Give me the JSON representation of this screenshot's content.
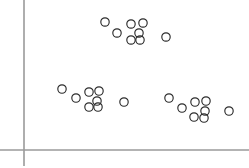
{
  "chart_data": {
    "type": "scatter",
    "title": "",
    "subtitle": "",
    "xlabel": "",
    "ylabel": "",
    "xlim": [
      0,
      249
    ],
    "ylim": [
      0,
      168
    ],
    "grid": false,
    "legend": null,
    "legend_position": "none",
    "tick_labels": {
      "x": [],
      "y": []
    },
    "annotations": [],
    "marker": {
      "shape": "open-circle",
      "radius": 4.2,
      "fill": "none",
      "stroke_color": "#2b2b2b",
      "stroke_width": 1.15
    },
    "axes": {
      "color": "#9a9a9a",
      "width": 1.6,
      "y_axis": {
        "x": 24,
        "y_start": 0,
        "y_end": 166
      },
      "x_axis": {
        "y": 150,
        "x_start": 0,
        "x_end": 249
      }
    },
    "series": [
      {
        "name": "cluster-top",
        "n_points": 9,
        "points": [
          {
            "x": 105,
            "y": 22
          },
          {
            "x": 117,
            "y": 33
          },
          {
            "x": 131,
            "y": 24
          },
          {
            "x": 143,
            "y": 23
          },
          {
            "x": 139,
            "y": 33
          },
          {
            "x": 131,
            "y": 40
          },
          {
            "x": 140,
            "y": 40
          },
          {
            "x": 166,
            "y": 37
          }
        ]
      },
      {
        "name": "cluster-left",
        "n_points": 8,
        "points": [
          {
            "x": 62,
            "y": 89
          },
          {
            "x": 76,
            "y": 98
          },
          {
            "x": 89,
            "y": 92
          },
          {
            "x": 99,
            "y": 91
          },
          {
            "x": 97,
            "y": 101
          },
          {
            "x": 89,
            "y": 107
          },
          {
            "x": 98,
            "y": 107
          },
          {
            "x": 124,
            "y": 102
          }
        ]
      },
      {
        "name": "cluster-right",
        "n_points": 9,
        "points": [
          {
            "x": 169,
            "y": 98
          },
          {
            "x": 182,
            "y": 108
          },
          {
            "x": 195,
            "y": 102
          },
          {
            "x": 206,
            "y": 101
          },
          {
            "x": 205,
            "y": 111
          },
          {
            "x": 194,
            "y": 117
          },
          {
            "x": 204,
            "y": 118
          },
          {
            "x": 229,
            "y": 111
          }
        ]
      }
    ]
  }
}
